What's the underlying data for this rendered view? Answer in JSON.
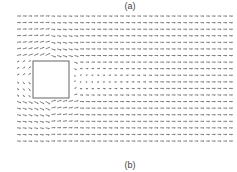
{
  "labels": {
    "top": "(a)",
    "bottom": "(b)"
  },
  "colors": {
    "arrow": "#555555",
    "obstacle": "#555555",
    "background": "#ffffff"
  },
  "chart_data": {
    "type": "quiver",
    "title": "",
    "subplot_labels": [
      "(a)",
      "(b)"
    ],
    "grid": {
      "x_start": 17,
      "x_end": 229,
      "cols": 38,
      "y_start": 16,
      "y_end": 141,
      "rows": 20
    },
    "obstacle": {
      "shape": "square",
      "x": 33,
      "y": 61,
      "width": 36,
      "height": 37
    },
    "freestream": {
      "u": 1.0,
      "v": 0.0
    },
    "wake": {
      "x_from": 69,
      "x_to": 150,
      "y_center": 79.5,
      "half_height": 20,
      "min_speed": 0.15
    },
    "axes": {
      "visible": false,
      "grid": false
    },
    "legend": null
  }
}
